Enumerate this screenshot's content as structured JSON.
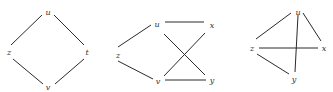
{
  "graphs": [
    {
      "id": "graph-1",
      "nodes": [
        {
          "label": "u",
          "x": 48,
          "y": 13
        },
        {
          "label": "z",
          "x": 9,
          "y": 53
        },
        {
          "label": "t",
          "x": 87,
          "y": 53
        },
        {
          "label": "v",
          "x": 48,
          "y": 88
        }
      ],
      "edges": [
        {
          "x1": 42,
          "y1": 15,
          "x2": 11,
          "y2": 45
        },
        {
          "x1": 54,
          "y1": 15,
          "x2": 84,
          "y2": 45
        },
        {
          "x1": 13,
          "y1": 59,
          "x2": 43,
          "y2": 84
        },
        {
          "x1": 84,
          "y1": 59,
          "x2": 55,
          "y2": 84
        }
      ]
    },
    {
      "id": "graph-2",
      "nodes": [
        {
          "label": "u",
          "x": 157,
          "y": 25
        },
        {
          "label": "z",
          "x": 118,
          "y": 56
        },
        {
          "label": "x",
          "x": 212,
          "y": 26
        },
        {
          "label": "v",
          "x": 158,
          "y": 82
        },
        {
          "label": "y",
          "x": 212,
          "y": 81
        }
      ],
      "edges": [
        {
          "x1": 165,
          "y1": 22,
          "x2": 204,
          "y2": 22
        },
        {
          "x1": 151,
          "y1": 25,
          "x2": 118,
          "y2": 47
        },
        {
          "x1": 118,
          "y1": 61,
          "x2": 153,
          "y2": 79
        },
        {
          "x1": 164,
          "y1": 34,
          "x2": 205,
          "y2": 75
        },
        {
          "x1": 164,
          "y1": 76,
          "x2": 205,
          "y2": 33
        },
        {
          "x1": 165,
          "y1": 80,
          "x2": 206,
          "y2": 80
        }
      ]
    },
    {
      "id": "graph-3",
      "nodes": [
        {
          "label": "u",
          "x": 298,
          "y": 13
        },
        {
          "label": "z",
          "x": 252,
          "y": 49
        },
        {
          "label": "x",
          "x": 324,
          "y": 49
        },
        {
          "label": "y",
          "x": 294,
          "y": 80
        }
      ],
      "edges": [
        {
          "x1": 291,
          "y1": 13,
          "x2": 256,
          "y2": 39
        },
        {
          "x1": 303,
          "y1": 13,
          "x2": 321,
          "y2": 41
        },
        {
          "x1": 298,
          "y1": 15,
          "x2": 295,
          "y2": 72
        },
        {
          "x1": 259,
          "y1": 48,
          "x2": 318,
          "y2": 48
        },
        {
          "x1": 257,
          "y1": 54,
          "x2": 289,
          "y2": 74
        }
      ]
    }
  ]
}
